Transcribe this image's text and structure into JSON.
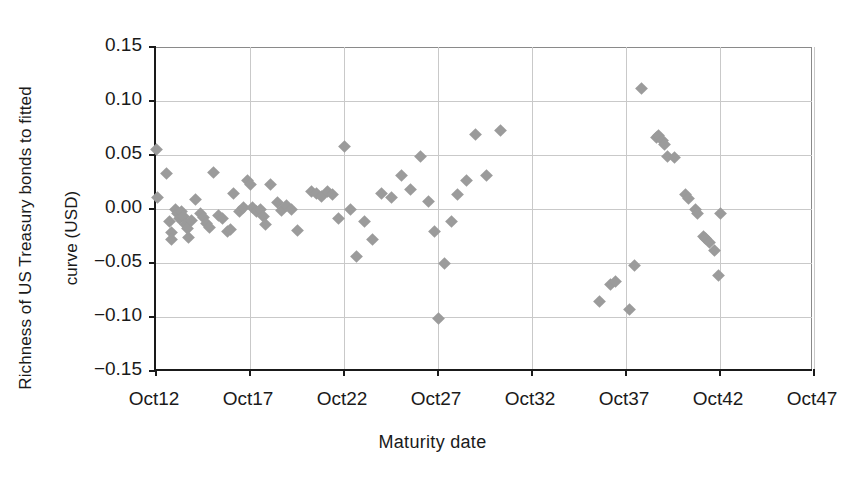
{
  "chart_data": {
    "type": "scatter",
    "title": "",
    "xlabel": "Maturity date",
    "ylabel": "Richness of US Treasury bonds to fitted curve (USD)",
    "ylabel_line1": "Richness of US Treasury bonds to fitted",
    "ylabel_line2": "curve (USD)",
    "xtick_labels": [
      "Oct12",
      "Oct17",
      "Oct22",
      "Oct27",
      "Oct32",
      "Oct37",
      "Oct42",
      "Oct47"
    ],
    "xtick_values": [
      2012,
      2017,
      2022,
      2027,
      2032,
      2037,
      2042,
      2047
    ],
    "ytick_labels": [
      "0.15",
      "0.10",
      "0.05",
      "0.00",
      "-0.05",
      "-0.10",
      "-0.15"
    ],
    "ytick_values": [
      0.15,
      0.1,
      0.05,
      0.0,
      -0.05,
      -0.1,
      -0.15
    ],
    "xlim": [
      2012,
      2047
    ],
    "ylim": [
      -0.15,
      0.15
    ],
    "grid": true,
    "legend": null,
    "marker": "diamond",
    "marker_color": "#9b9b9b",
    "series": [
      {
        "name": "US Treasury bonds",
        "points": [
          [
            2012.05,
            0.055
          ],
          [
            2012.1,
            0.011
          ],
          [
            2012.55,
            0.033
          ],
          [
            2012.7,
            -0.012
          ],
          [
            2012.8,
            -0.022
          ],
          [
            2012.85,
            -0.028
          ],
          [
            2013.05,
            0.0
          ],
          [
            2013.15,
            -0.004
          ],
          [
            2013.25,
            -0.009
          ],
          [
            2013.35,
            -0.002
          ],
          [
            2013.45,
            -0.007
          ],
          [
            2013.55,
            -0.014
          ],
          [
            2013.65,
            -0.018
          ],
          [
            2013.75,
            -0.026
          ],
          [
            2013.9,
            -0.011
          ],
          [
            2014.1,
            0.009
          ],
          [
            2014.35,
            -0.004
          ],
          [
            2014.55,
            -0.008
          ],
          [
            2014.7,
            -0.013
          ],
          [
            2014.85,
            -0.017
          ],
          [
            2015.05,
            0.034
          ],
          [
            2015.35,
            -0.006
          ],
          [
            2015.55,
            -0.009
          ],
          [
            2015.8,
            -0.021
          ],
          [
            2015.95,
            -0.019
          ],
          [
            2016.1,
            0.014
          ],
          [
            2016.45,
            -0.002
          ],
          [
            2016.65,
            0.001
          ],
          [
            2016.85,
            0.026
          ],
          [
            2017.0,
            0.023
          ],
          [
            2017.15,
            0.001
          ],
          [
            2017.35,
            -0.002
          ],
          [
            2017.55,
            0.0
          ],
          [
            2017.7,
            -0.007
          ],
          [
            2017.85,
            -0.014
          ],
          [
            2018.1,
            0.023
          ],
          [
            2018.45,
            0.006
          ],
          [
            2018.7,
            -0.001
          ],
          [
            2018.95,
            0.003
          ],
          [
            2019.2,
            0.0
          ],
          [
            2019.55,
            -0.02
          ],
          [
            2020.25,
            0.016
          ],
          [
            2020.55,
            0.014
          ],
          [
            2020.8,
            0.012
          ],
          [
            2021.1,
            0.016
          ],
          [
            2021.4,
            0.013
          ],
          [
            2021.7,
            -0.009
          ],
          [
            2022.05,
            0.058
          ],
          [
            2022.35,
            0.0
          ],
          [
            2022.65,
            -0.044
          ],
          [
            2023.1,
            -0.012
          ],
          [
            2023.5,
            -0.028
          ],
          [
            2024.0,
            0.014
          ],
          [
            2024.55,
            0.011
          ],
          [
            2025.05,
            0.031
          ],
          [
            2025.55,
            0.018
          ],
          [
            2026.05,
            0.049
          ],
          [
            2026.5,
            0.007
          ],
          [
            2026.8,
            -0.021
          ],
          [
            2027.05,
            -0.101
          ],
          [
            2027.35,
            -0.05
          ],
          [
            2027.7,
            -0.012
          ],
          [
            2028.05,
            0.013
          ],
          [
            2028.5,
            0.026
          ],
          [
            2029.0,
            0.069
          ],
          [
            2029.6,
            0.031
          ],
          [
            2030.3,
            0.073
          ],
          [
            2035.6,
            -0.086
          ],
          [
            2036.2,
            -0.07
          ],
          [
            2036.45,
            -0.067
          ],
          [
            2037.2,
            -0.093
          ],
          [
            2037.45,
            -0.052
          ],
          [
            2037.8,
            0.112
          ],
          [
            2038.6,
            0.066
          ],
          [
            2038.75,
            0.068
          ],
          [
            2038.95,
            0.063
          ],
          [
            2039.05,
            0.06
          ],
          [
            2039.2,
            0.049
          ],
          [
            2039.6,
            0.048
          ],
          [
            2040.15,
            0.013
          ],
          [
            2040.3,
            0.01
          ],
          [
            2040.7,
            0.0
          ],
          [
            2040.8,
            -0.004
          ],
          [
            2041.1,
            -0.025
          ],
          [
            2041.25,
            -0.027
          ],
          [
            2041.45,
            -0.031
          ],
          [
            2041.7,
            -0.038
          ],
          [
            2041.9,
            -0.062
          ],
          [
            2042.05,
            -0.004
          ]
        ]
      }
    ]
  }
}
